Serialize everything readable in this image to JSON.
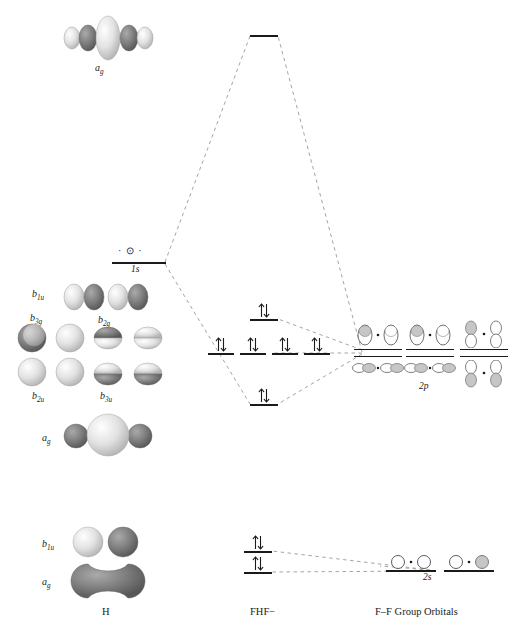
{
  "figure": {
    "type": "molecular-orbital-energy-diagram"
  },
  "columns": {
    "left_label": "H",
    "center_label": "FHF−",
    "right_label": "F–F Group Orbitals"
  },
  "atomic_levels": {
    "h_1s": {
      "label": "1s",
      "symbol": "· ⊙ ·"
    },
    "f_2p": {
      "label": "2p"
    },
    "f_2s": {
      "label": "2s"
    }
  },
  "mo_levels": [
    {
      "name": "sigma-star-antibonding",
      "electrons": "",
      "occupancy": 0
    },
    {
      "name": "nonbonding-upper",
      "electrons": "↑↓",
      "occupancy": 2
    },
    {
      "name": "nonbonding-degenerate-1",
      "electrons": "↑↓",
      "occupancy": 2
    },
    {
      "name": "nonbonding-degenerate-2",
      "electrons": "↑↓",
      "occupancy": 2
    },
    {
      "name": "nonbonding-degenerate-3",
      "electrons": "↑↓",
      "occupancy": 2
    },
    {
      "name": "nonbonding-degenerate-4",
      "electrons": "↑↓",
      "occupancy": 2
    },
    {
      "name": "sigma-bonding",
      "electrons": "↑↓",
      "occupancy": 2
    },
    {
      "name": "2s-derived-upper",
      "electrons": "↑↓",
      "occupancy": 2
    },
    {
      "name": "2s-derived-lower",
      "electrons": "↑↓",
      "occupancy": 2
    }
  ],
  "left_orbitals": [
    {
      "id": "top-ag",
      "label": "a",
      "sub": "g"
    },
    {
      "id": "b1u-p",
      "label": "b",
      "sub": "1u"
    },
    {
      "id": "b3g",
      "label": "b",
      "sub": "3g"
    },
    {
      "id": "b2g",
      "label": "b",
      "sub": "2g"
    },
    {
      "id": "b2u",
      "label": "b",
      "sub": "2u"
    },
    {
      "id": "b3u",
      "label": "b",
      "sub": "3u"
    },
    {
      "id": "mid-ag",
      "label": "a",
      "sub": "g"
    },
    {
      "id": "bottom-b1u",
      "label": "b",
      "sub": "1u"
    },
    {
      "id": "bottom-ag",
      "label": "a",
      "sub": "g"
    }
  ],
  "colors": {
    "line": "#1a1a1a",
    "dashed": "#9a9a9a",
    "lobe_light": "#e8e8e8",
    "lobe_dark": "#6f6f6f",
    "lobe_mid": "#bfbfbf"
  }
}
